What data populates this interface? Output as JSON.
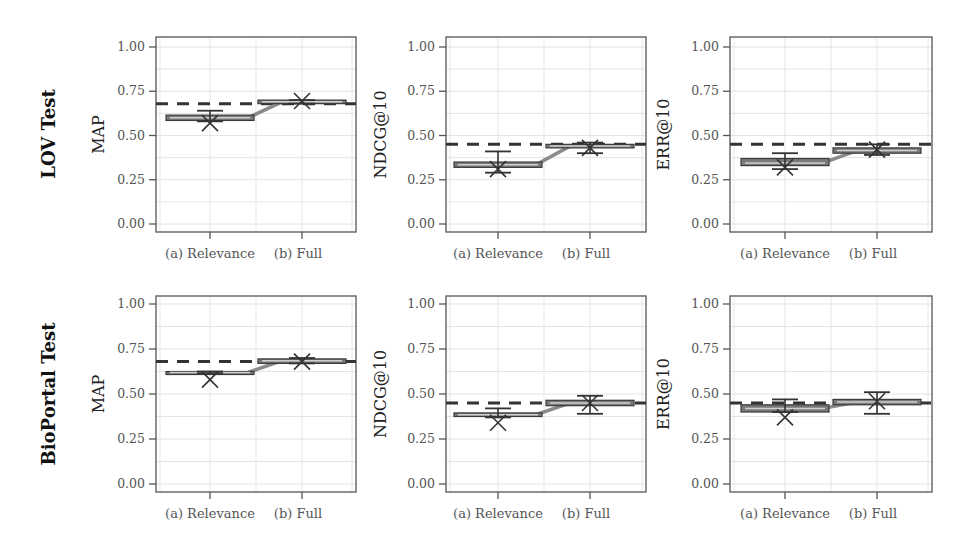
{
  "figure": {
    "row_labels": [
      "LOV Test",
      "BioPortal Test"
    ],
    "category_labels": [
      "(a) Relevance",
      "(b) Full"
    ],
    "ytick_labels": [
      "0.00",
      "0.25",
      "0.50",
      "0.75",
      "1.00"
    ]
  },
  "colors": {
    "axes": "#555555",
    "grid": "#dddddd",
    "box_fill": "#7a7a7a",
    "box_edge": "#3a3a3a",
    "median": "#cfcfcf",
    "connector": "#8a8a8a",
    "whisker": "#333333",
    "baseline_dash": "#333333",
    "marker": "#333333"
  },
  "chart_data": [
    {
      "type": "box",
      "row": "LOV Test",
      "ylabel": "MAP",
      "categories": [
        "(a) Relevance",
        "(b) Full"
      ],
      "ylim": [
        0,
        1
      ],
      "yticks": [
        0,
        0.25,
        0.5,
        0.75,
        1.0
      ],
      "grid": true,
      "baseline": 0.68,
      "series": [
        {
          "category": "(a) Relevance",
          "q1": 0.585,
          "median": 0.6,
          "q3": 0.615,
          "whisker_low": 0.58,
          "whisker_high": 0.64,
          "mean_marker": 0.57
        },
        {
          "category": "(b) Full",
          "q1": 0.68,
          "median": 0.69,
          "q3": 0.7,
          "whisker_low": 0.68,
          "whisker_high": 0.7,
          "mean_marker": 0.695
        }
      ]
    },
    {
      "type": "box",
      "row": "LOV Test",
      "ylabel": "NDCG@10",
      "categories": [
        "(a) Relevance",
        "(b) Full"
      ],
      "ylim": [
        0,
        1
      ],
      "yticks": [
        0,
        0.25,
        0.5,
        0.75,
        1.0
      ],
      "grid": true,
      "baseline": 0.45,
      "series": [
        {
          "category": "(a) Relevance",
          "q1": 0.32,
          "median": 0.335,
          "q3": 0.35,
          "whisker_low": 0.29,
          "whisker_high": 0.41,
          "mean_marker": 0.31
        },
        {
          "category": "(b) Full",
          "q1": 0.43,
          "median": 0.44,
          "q3": 0.45,
          "whisker_low": 0.4,
          "whisker_high": 0.46,
          "mean_marker": 0.43
        }
      ]
    },
    {
      "type": "box",
      "row": "LOV Test",
      "ylabel": "ERR@10",
      "categories": [
        "(a) Relevance",
        "(b) Full"
      ],
      "ylim": [
        0,
        1
      ],
      "yticks": [
        0,
        0.25,
        0.5,
        0.75,
        1.0
      ],
      "grid": true,
      "baseline": 0.45,
      "series": [
        {
          "category": "(a) Relevance",
          "q1": 0.33,
          "median": 0.345,
          "q3": 0.37,
          "whisker_low": 0.31,
          "whisker_high": 0.4,
          "mean_marker": 0.32
        },
        {
          "category": "(b) Full",
          "q1": 0.4,
          "median": 0.415,
          "q3": 0.43,
          "whisker_low": 0.39,
          "whisker_high": 0.45,
          "mean_marker": 0.42
        }
      ]
    },
    {
      "type": "box",
      "row": "BioPortal Test",
      "ylabel": "MAP",
      "categories": [
        "(a) Relevance",
        "(b) Full"
      ],
      "ylim": [
        0,
        1
      ],
      "yticks": [
        0,
        0.25,
        0.5,
        0.75,
        1.0
      ],
      "grid": true,
      "baseline": 0.68,
      "series": [
        {
          "category": "(a) Relevance",
          "q1": 0.615,
          "median": 0.62,
          "q3": 0.625,
          "whisker_low": 0.615,
          "whisker_high": 0.625,
          "mean_marker": 0.58
        },
        {
          "category": "(b) Full",
          "q1": 0.67,
          "median": 0.685,
          "q3": 0.695,
          "whisker_low": 0.67,
          "whisker_high": 0.7,
          "mean_marker": 0.68
        }
      ]
    },
    {
      "type": "box",
      "row": "BioPortal Test",
      "ylabel": "NDCG@10",
      "categories": [
        "(a) Relevance",
        "(b) Full"
      ],
      "ylim": [
        0,
        1
      ],
      "yticks": [
        0,
        0.25,
        0.5,
        0.75,
        1.0
      ],
      "grid": true,
      "baseline": 0.45,
      "series": [
        {
          "category": "(a) Relevance",
          "q1": 0.375,
          "median": 0.385,
          "q3": 0.395,
          "whisker_low": 0.37,
          "whisker_high": 0.42,
          "mean_marker": 0.34
        },
        {
          "category": "(b) Full",
          "q1": 0.435,
          "median": 0.45,
          "q3": 0.465,
          "whisker_low": 0.39,
          "whisker_high": 0.49,
          "mean_marker": 0.45
        }
      ]
    },
    {
      "type": "box",
      "row": "BioPortal Test",
      "ylabel": "ERR@10",
      "categories": [
        "(a) Relevance",
        "(b) Full"
      ],
      "ylim": [
        0,
        1
      ],
      "yticks": [
        0,
        0.25,
        0.5,
        0.75,
        1.0
      ],
      "grid": true,
      "baseline": 0.45,
      "series": [
        {
          "category": "(a) Relevance",
          "q1": 0.4,
          "median": 0.42,
          "q3": 0.44,
          "whisker_low": 0.4,
          "whisker_high": 0.47,
          "mean_marker": 0.37
        },
        {
          "category": "(b) Full",
          "q1": 0.44,
          "median": 0.455,
          "q3": 0.47,
          "whisker_low": 0.39,
          "whisker_high": 0.51,
          "mean_marker": 0.46
        }
      ]
    }
  ]
}
